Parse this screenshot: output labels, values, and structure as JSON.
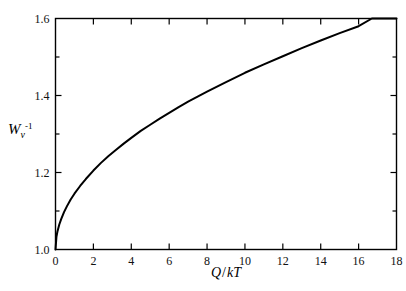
{
  "chart_data": {
    "type": "line",
    "title": "",
    "subtitle": "",
    "xlabel": "Q / kT",
    "ylabel": "W_v^-1",
    "ylabel_parts": {
      "base": "W",
      "subscript": "v",
      "superscript": "-1"
    },
    "xlabel_parts": {
      "numerator": "Q",
      "separator": "/",
      "denominator": "kT"
    },
    "xlim": [
      0,
      18
    ],
    "ylim": [
      1.0,
      1.6
    ],
    "xticks": [
      0,
      2,
      4,
      6,
      8,
      10,
      12,
      14,
      16,
      18
    ],
    "xtick_labels": [
      "0",
      "2",
      "4",
      "6",
      "8",
      "10",
      "12",
      "14",
      "16",
      "18"
    ],
    "yticks": [
      1.0,
      1.2,
      1.4,
      1.6
    ],
    "ytick_labels": [
      "1.0",
      "1.2",
      "1.4",
      "1.6"
    ],
    "yminor_ticks": [
      1.1,
      1.3,
      1.5
    ],
    "grid": false,
    "legend": null,
    "tick_direction": "in",
    "frame": "box",
    "line_color": "#000000",
    "line_width": 2.0,
    "series": [
      {
        "name": "Wv inverse vs Q/kT",
        "x": [
          0.0,
          0.05,
          0.1,
          0.2,
          0.3,
          0.45,
          0.6,
          0.8,
          1.0,
          1.3,
          1.6,
          2.0,
          2.4,
          2.8,
          3.2,
          3.6,
          4.0,
          4.5,
          5.0,
          5.5,
          6.0,
          6.5,
          7.0,
          7.5,
          8.0,
          9.0,
          10.0,
          11.0,
          12.0,
          13.0,
          14.0,
          15.0,
          16.0,
          16.7,
          17.0,
          18.0
        ],
        "y": [
          1.0,
          1.033,
          1.046,
          1.065,
          1.079,
          1.097,
          1.112,
          1.13,
          1.145,
          1.165,
          1.183,
          1.205,
          1.225,
          1.243,
          1.259,
          1.275,
          1.29,
          1.308,
          1.324,
          1.34,
          1.355,
          1.37,
          1.384,
          1.397,
          1.41,
          1.435,
          1.459,
          1.481,
          1.502,
          1.523,
          1.543,
          1.562,
          1.58,
          1.6,
          1.6,
          1.6
        ]
      }
    ]
  }
}
